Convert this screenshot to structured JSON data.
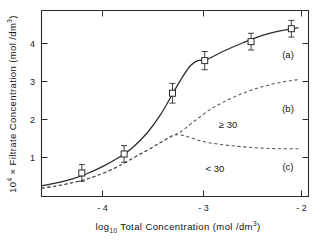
{
  "chart_data": {
    "type": "line",
    "title": "",
    "xlabel": "log10 Total Concentration (mol/dm3)",
    "ylabel": "10^4 x Filtrate Concentration (mol/dm3)",
    "xlim": [
      -4.6,
      -1.95
    ],
    "ylim": [
      0,
      4.9
    ],
    "xticks": [
      -4,
      -3,
      -2
    ],
    "xticklabels": [
      "- 4",
      "- 3",
      "- 2"
    ],
    "yticks": [
      1,
      2,
      3,
      4
    ],
    "yticklabels": [
      "1",
      "2",
      "3",
      "4"
    ],
    "grid": false,
    "legend": "inline-curve-labels",
    "series": [
      {
        "name": "(a)",
        "label": "(a)",
        "style": "solid",
        "x": [
          -4.6,
          -4.45,
          -4.3,
          -4.15,
          -4.0,
          -3.85,
          -3.7,
          -3.55,
          -3.42,
          -3.3,
          -3.2,
          -3.12,
          -3.05,
          -2.95,
          -2.8,
          -2.6,
          -2.4,
          -2.2,
          -2.05
        ],
        "y": [
          0.28,
          0.36,
          0.46,
          0.6,
          0.78,
          1.0,
          1.28,
          1.68,
          2.15,
          2.7,
          3.15,
          3.45,
          3.58,
          3.62,
          3.82,
          4.05,
          4.25,
          4.38,
          4.45
        ]
      },
      {
        "name": "(b)",
        "label": "(b)",
        "style": "dashed",
        "annotation": "≥ 30",
        "x": [
          -4.6,
          -4.45,
          -4.3,
          -4.15,
          -4.0,
          -3.85,
          -3.7,
          -3.55,
          -3.42,
          -3.3,
          -3.22,
          -3.1,
          -2.95,
          -2.8,
          -2.6,
          -2.4,
          -2.2,
          -2.05
        ],
        "y": [
          0.22,
          0.28,
          0.36,
          0.46,
          0.6,
          0.78,
          1.0,
          1.22,
          1.42,
          1.6,
          1.7,
          1.95,
          2.25,
          2.48,
          2.72,
          2.9,
          3.02,
          3.08
        ]
      },
      {
        "name": "(c)",
        "label": "(c)",
        "style": "dashed",
        "annotation": "< 30",
        "x": [
          -4.6,
          -4.45,
          -4.3,
          -4.15,
          -4.0,
          -3.85,
          -3.7,
          -3.55,
          -3.42,
          -3.3,
          -3.22,
          -3.12,
          -3.0,
          -2.85,
          -2.65,
          -2.45,
          -2.25,
          -2.05
        ],
        "y": [
          0.22,
          0.28,
          0.36,
          0.46,
          0.6,
          0.78,
          1.0,
          1.22,
          1.42,
          1.6,
          1.62,
          1.55,
          1.45,
          1.38,
          1.32,
          1.28,
          1.26,
          1.26
        ]
      }
    ],
    "data_points": [
      {
        "x": -4.2,
        "y": 0.62,
        "yerr": 0.22
      },
      {
        "x": -3.78,
        "y": 1.12,
        "yerr": 0.22
      },
      {
        "x": -3.3,
        "y": 2.72,
        "yerr": 0.26
      },
      {
        "x": -2.98,
        "y": 3.58,
        "yerr": 0.24
      },
      {
        "x": -2.52,
        "y": 4.08,
        "yerr": 0.22
      },
      {
        "x": -2.12,
        "y": 4.42,
        "yerr": 0.22
      }
    ],
    "marker_style": "open-square"
  },
  "axis": {
    "ylabel_parts": {
      "prefix": "10",
      "exp": "4",
      "mid": " × Filtrate  Concentration",
      "units_open": "  (mol /dm",
      "units_exp": "3",
      "units_close": ")"
    },
    "xlabel_parts": {
      "prefix": "log",
      "sub": "10",
      "mid": " Total  Concentration",
      "units_open": "  (mol /dm",
      "units_exp": "3",
      "units_close": ")"
    }
  },
  "labels": {
    "curve_a": "(a)",
    "curve_b": "(b)",
    "curve_c": "(c)",
    "annot_ge30": "≥ 30",
    "annot_lt30": "< 30",
    "xtick_m4": "- 4",
    "xtick_m3": "- 3",
    "xtick_m2": "- 2",
    "ytick_1": "1",
    "ytick_2": "2",
    "ytick_3": "3",
    "ytick_4": "4"
  },
  "colors": {
    "axis": "#2b2b2b",
    "solid_curve": "#2b2b2b",
    "dashed_curve": "#555555",
    "background": "#ffffff"
  }
}
